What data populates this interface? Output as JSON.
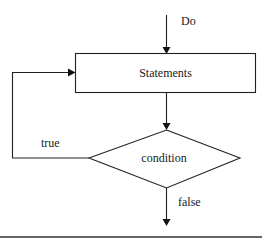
{
  "diagram": {
    "type": "flowchart",
    "entry_label": "Do",
    "nodes": [
      {
        "id": "statements",
        "shape": "rectangle",
        "label": "Statements"
      },
      {
        "id": "condition",
        "shape": "diamond",
        "label": "condition"
      }
    ],
    "edges": [
      {
        "from": "start",
        "to": "statements",
        "label": "Do"
      },
      {
        "from": "statements",
        "to": "condition",
        "label": ""
      },
      {
        "from": "condition",
        "to": "statements",
        "label": "true"
      },
      {
        "from": "condition",
        "to": "exit",
        "label": "false"
      }
    ],
    "labels": {
      "do": "Do",
      "statements": "Statements",
      "condition": "condition",
      "true": "true",
      "false": "false"
    },
    "colors": {
      "stroke": "#222222",
      "background": "#ffffff",
      "text": "#1a1a1a"
    }
  }
}
